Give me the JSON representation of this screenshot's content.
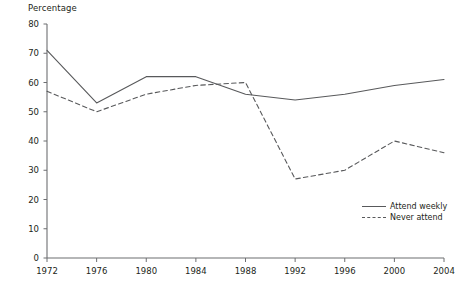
{
  "chart_data": {
    "type": "line",
    "title": "",
    "subtitle": "",
    "ylabel": "Percentage",
    "xlabel": "",
    "ylim": [
      0,
      80
    ],
    "yticks": [
      0,
      10,
      20,
      30,
      40,
      50,
      60,
      70,
      80
    ],
    "grid": false,
    "legend_position": "bottom-right",
    "categories": [
      1972,
      1976,
      1980,
      1984,
      1988,
      1992,
      1996,
      2000,
      2004
    ],
    "x": [
      1972,
      1976,
      1980,
      1984,
      1988,
      1992,
      1996,
      2000,
      2004
    ],
    "xtick_labels": [
      "1972",
      "1976",
      "1980",
      "1984",
      "1988",
      "1992",
      "1996",
      "2000",
      "2004"
    ],
    "series": [
      {
        "name": "Attend weekly",
        "style": "solid",
        "color": "#58595b",
        "values": [
          71,
          53,
          62,
          62,
          56,
          54,
          56,
          59,
          61
        ]
      },
      {
        "name": "Never attend",
        "style": "dashed",
        "color": "#58595b",
        "values": [
          57,
          50,
          56,
          59,
          60,
          27,
          30,
          40,
          36
        ]
      }
    ]
  },
  "axis": {
    "y_title": "Percentage"
  },
  "legend": {
    "items": [
      {
        "label": "Attend weekly",
        "style": "solid"
      },
      {
        "label": "Never attend",
        "style": "dashed"
      }
    ]
  }
}
